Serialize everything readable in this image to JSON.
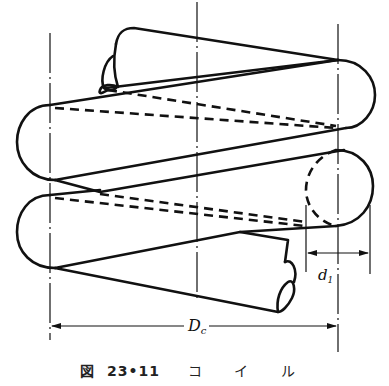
{
  "figure": {
    "caption_prefix": "図",
    "caption_number": "23•11",
    "caption_title": "コイル",
    "caption_title_spaced": "コ イ ル"
  },
  "labels": {
    "coil_diameter": "D",
    "coil_diameter_sub": "c",
    "wire_diameter": "d",
    "wire_diameter_sub": "1"
  },
  "dimensions": [
    {
      "name": "coil-mean-diameter",
      "symbol": "Dc",
      "from": "left-centerline",
      "to": "right-centerline"
    },
    {
      "name": "wire-diameter",
      "symbol": "d1",
      "from": "wire-left-edge",
      "to": "wire-right-edge"
    }
  ],
  "colors": {
    "ink": "#111111",
    "background": "#ffffff"
  }
}
